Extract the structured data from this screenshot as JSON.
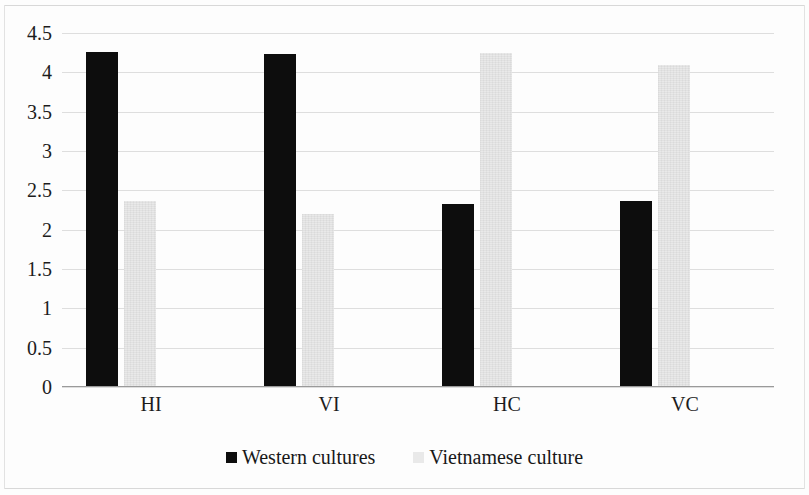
{
  "chart_data": {
    "type": "bar",
    "title": "",
    "subtitle": "",
    "xlabel": "",
    "ylabel": "",
    "categories": [
      "HI",
      "VI",
      "HC",
      "VC"
    ],
    "series": [
      {
        "name": "Western cultures",
        "color": "#0d0d0d",
        "values": [
          4.26,
          4.23,
          2.33,
          2.36
        ]
      },
      {
        "name": "Vietnamese culture",
        "color": "#e9e9e9",
        "values": [
          2.37,
          2.2,
          4.25,
          4.09
        ]
      }
    ],
    "ylim": [
      0,
      4.5
    ],
    "yticks": [
      "0",
      "0.5",
      "1",
      "1.5",
      "2",
      "2.5",
      "3",
      "3.5",
      "4",
      "4.5"
    ],
    "ytick_values": [
      0,
      0.5,
      1,
      1.5,
      2,
      2.5,
      3,
      3.5,
      4,
      4.5
    ],
    "grid": true,
    "grid_axis": "y",
    "legend_position": "bottom",
    "legend": [
      "Western cultures",
      "Vietnamese culture"
    ]
  }
}
